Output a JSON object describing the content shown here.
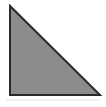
{
  "figure": {
    "shape_type": "right triangle",
    "background_color": "#ffffff",
    "canvas": {
      "width": 106,
      "height": 107
    },
    "shapes": [
      {
        "name": "right-triangle",
        "kind": "polygon",
        "points": "10,6 10,95 100,95",
        "vertices": [
          {
            "label": "top",
            "x": 10,
            "y": 6
          },
          {
            "label": "bottom-left",
            "x": 10,
            "y": 95
          },
          {
            "label": "bottom-right",
            "x": 100,
            "y": 95
          }
        ],
        "fill_color": "#8c8c8c",
        "stroke_color": "#2b2b2b",
        "stroke_width": 2,
        "right_angle_at": "bottom-left"
      },
      {
        "name": "base-shadow-line",
        "kind": "line",
        "x1": 6,
        "y1": 100,
        "x2": 100,
        "y2": 100,
        "stroke_color": "#e2e2e2",
        "stroke_width": 1
      }
    ]
  }
}
